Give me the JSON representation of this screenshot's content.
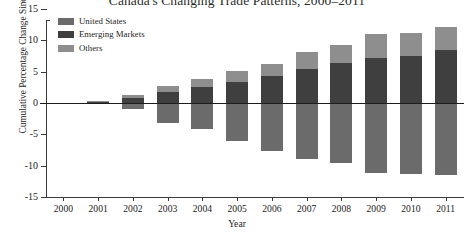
{
  "chart_data": {
    "type": "bar",
    "title": "Canada's Changing Trade Patterns, 2000–2011",
    "xlabel": "Year",
    "ylabel": "Cumulative Percentage Change Since 2000",
    "categories": [
      "2000",
      "2001",
      "2002",
      "2003",
      "2004",
      "2005",
      "2006",
      "2007",
      "2008",
      "2009",
      "2010",
      "2011"
    ],
    "ylim": [
      -15,
      15
    ],
    "yticks": [
      15,
      10,
      5,
      0,
      -5,
      -10,
      -15
    ],
    "ytick_labels": [
      "15",
      "10",
      "5",
      "0",
      "-5",
      "-10",
      "-15"
    ],
    "grid": false,
    "stacked": true,
    "legend_position": "top-left",
    "series": [
      {
        "name": "United States",
        "color": "#6b6b6b",
        "values": [
          0,
          -0.2,
          -0.9,
          -3.2,
          -4.2,
          -6.1,
          -7.6,
          -8.9,
          -9.6,
          -11.2,
          -11.4,
          -11.5
        ]
      },
      {
        "name": "Emerging Markets",
        "color": "#3f3f3f",
        "values": [
          0,
          0.2,
          0.8,
          1.8,
          2.6,
          3.4,
          4.3,
          5.4,
          6.4,
          7.2,
          7.5,
          8.5
        ]
      },
      {
        "name": "Others",
        "color": "#8e8e8e",
        "values": [
          0,
          0.1,
          0.4,
          0.9,
          1.2,
          1.7,
          1.9,
          2.7,
          2.9,
          3.8,
          3.6,
          3.7
        ]
      }
    ]
  }
}
